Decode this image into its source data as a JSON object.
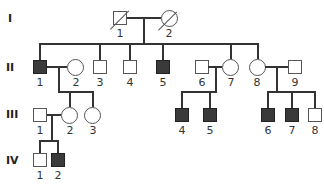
{
  "diagram": {
    "type": "pedigree",
    "colors": {
      "affected": "#3a3a3a",
      "unaffected": "#ffffff",
      "line": "#333333"
    },
    "generations": [
      {
        "label": "I",
        "members": [
          {
            "id": "1",
            "sex": "male",
            "affected": false,
            "deceased": true
          },
          {
            "id": "2",
            "sex": "female",
            "affected": false,
            "deceased": true
          }
        ]
      },
      {
        "label": "II",
        "members": [
          {
            "id": "1",
            "sex": "male",
            "affected": true
          },
          {
            "id": "2",
            "sex": "female",
            "affected": false
          },
          {
            "id": "3",
            "sex": "male",
            "affected": false
          },
          {
            "id": "4",
            "sex": "male",
            "affected": false
          },
          {
            "id": "5",
            "sex": "male",
            "affected": true
          },
          {
            "id": "6",
            "sex": "male",
            "affected": false
          },
          {
            "id": "7",
            "sex": "female",
            "affected": false
          },
          {
            "id": "8",
            "sex": "female",
            "affected": false
          },
          {
            "id": "9",
            "sex": "male",
            "affected": false
          }
        ]
      },
      {
        "label": "III",
        "members": [
          {
            "id": "1",
            "sex": "male",
            "affected": false
          },
          {
            "id": "2",
            "sex": "female",
            "affected": false
          },
          {
            "id": "3",
            "sex": "female",
            "affected": false
          },
          {
            "id": "4",
            "sex": "male",
            "affected": true
          },
          {
            "id": "5",
            "sex": "male",
            "affected": true
          },
          {
            "id": "6",
            "sex": "male",
            "affected": true
          },
          {
            "id": "7",
            "sex": "male",
            "affected": true
          },
          {
            "id": "8",
            "sex": "male",
            "affected": false
          }
        ]
      },
      {
        "label": "IV",
        "members": [
          {
            "id": "1",
            "sex": "male",
            "affected": false
          },
          {
            "id": "2",
            "sex": "male",
            "affected": true
          }
        ]
      }
    ]
  }
}
